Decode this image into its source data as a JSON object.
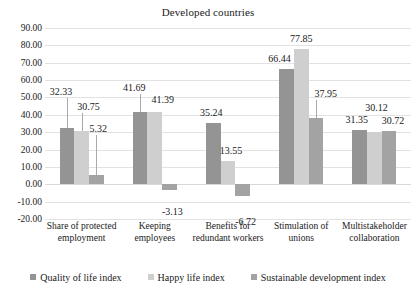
{
  "chart_data": {
    "type": "bar",
    "title": "Developed countries",
    "xlabel": "",
    "ylabel": "",
    "ylim": [
      -20,
      90
    ],
    "ytick_step": 10,
    "ytick_labels": [
      "90.00",
      "80.00",
      "70.00",
      "60.00",
      "50.00",
      "40.00",
      "30.00",
      "20.00",
      "10.00",
      "0.00",
      "-10.00",
      "-20.00"
    ],
    "ytick_values": [
      90,
      80,
      70,
      60,
      50,
      40,
      30,
      20,
      10,
      0,
      -10,
      -20
    ],
    "grid": true,
    "legend_position": "bottom",
    "categories": [
      "Share of protected employment",
      "Keeping employees",
      "Benefits for redundant workers",
      "Stimulation of unions",
      "Multistakeholder collaboration"
    ],
    "category_lines": [
      [
        "Share of protected",
        "employment"
      ],
      [
        "Keeping",
        "employees"
      ],
      [
        "Benefits for",
        "redundant workers"
      ],
      [
        "Stimulation of",
        "unions"
      ],
      [
        "Multistakeholder",
        "collaboration"
      ]
    ],
    "series": [
      {
        "name": "Quality of life index",
        "color": "#949494",
        "values": [
          32.33,
          41.69,
          35.24,
          66.44,
          31.35
        ],
        "labels": [
          "32.33",
          "41.69",
          "35.24",
          "66.44",
          "31.35"
        ]
      },
      {
        "name": "Happy life index",
        "color": "#cfcfcf",
        "values": [
          30.75,
          41.39,
          13.55,
          77.85,
          30.12
        ],
        "labels": [
          "30.75",
          "41.39",
          "13.55",
          "77.85",
          "30.12"
        ]
      },
      {
        "name": "Sustainable development index",
        "color": "#a3a3a3",
        "values": [
          5.32,
          -3.13,
          -6.72,
          37.95,
          30.72
        ],
        "labels": [
          "5.32",
          "-3.13",
          "-6.72",
          "37.95",
          "30.72"
        ]
      }
    ]
  }
}
